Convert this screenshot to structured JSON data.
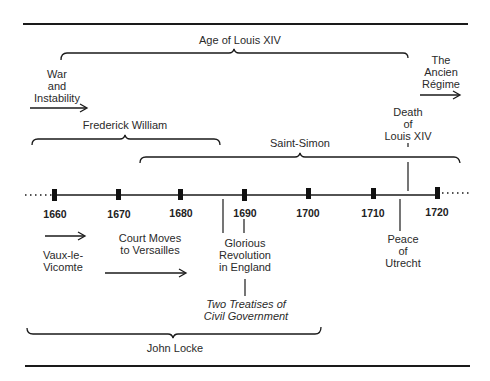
{
  "diagram": {
    "type": "timeline",
    "axis": {
      "years": [
        "1660",
        "1670",
        "1680",
        "1690",
        "1700",
        "1710",
        "1720"
      ],
      "start": 1660,
      "end": 1720,
      "extends_both_directions": true
    },
    "spans": {
      "age_of_louis_xiv": {
        "label": "Age of Louis XIV"
      },
      "frederick_william": {
        "label": "Frederick William"
      },
      "saint_simon": {
        "label": "Saint-Simon"
      },
      "john_locke": {
        "label": "John Locke"
      }
    },
    "arrows": {
      "war_and_instability": {
        "label": "War\nand\nInstability"
      },
      "ancien_regime": {
        "label": "The\nAncien\nRégime"
      },
      "vaux_le_vicomte": {
        "label": "Vaux-le-\nVicomte"
      },
      "court_moves": {
        "label": "Court Moves\nto Versailles"
      }
    },
    "events": {
      "death_of_louis_xiv": {
        "label": "Death\nof\nLouis XIV"
      },
      "glorious_revolution": {
        "label": "Glorious\nRevolution\nin England"
      },
      "two_treatises": {
        "label": "Two Treatises of\nCivil Government"
      },
      "peace_of_utrecht": {
        "label": "Peace\nof\nUtrecht"
      }
    },
    "colors": {
      "ink": "#1a1a1a",
      "background": "#ffffff"
    }
  }
}
